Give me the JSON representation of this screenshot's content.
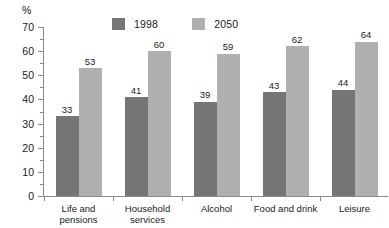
{
  "chart_data": {
    "type": "bar",
    "title": "",
    "subtitle": "",
    "xlabel": "",
    "ylabel": "%",
    "ylim": [
      0,
      70
    ],
    "ytick_step": 10,
    "yminor_step": 5,
    "grid": false,
    "legend_position": "top-center",
    "categories": [
      "Life and pensions",
      "Household services",
      "Alcohol",
      "Food and drink",
      "Leisure"
    ],
    "category_lines": [
      [
        "Life and",
        "pensions"
      ],
      [
        "Household",
        "services"
      ],
      [
        "Alcohol"
      ],
      [
        "Food and drink"
      ],
      [
        "Leisure"
      ]
    ],
    "ytick_labels": [
      "0",
      "10",
      "20",
      "30",
      "40",
      "50",
      "60",
      "70"
    ],
    "ytick_values": [
      0,
      10,
      20,
      30,
      40,
      50,
      60,
      70
    ],
    "series": [
      {
        "name": "1998",
        "color": "#757575",
        "values": [
          33,
          41,
          39,
          43,
          44
        ],
        "labels": [
          "33",
          "41",
          "39",
          "43",
          "44"
        ]
      },
      {
        "name": "2050",
        "color": "#b0b0b0",
        "values": [
          53,
          60,
          59,
          62,
          64
        ],
        "labels": [
          "53",
          "60",
          "59",
          "62",
          "64"
        ]
      }
    ]
  },
  "axis": {
    "unit_label": "%",
    "axis_color": "#8a8a8a"
  },
  "legend": {
    "entries": [
      {
        "label": "1998",
        "color": "#757575"
      },
      {
        "label": "2050",
        "color": "#b0b0b0"
      }
    ]
  }
}
